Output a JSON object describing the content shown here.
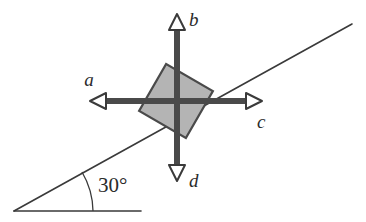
{
  "figure": {
    "background_color": "#ffffff",
    "width": 366,
    "height": 222,
    "incline": {
      "angle_label": "30°",
      "angle_degrees": 30,
      "line_color": "#3a3a3a",
      "baseline_color": "#3a3a3a",
      "vertex": {
        "x": 14,
        "y": 211
      },
      "slope_end": {
        "x": 352,
        "y": 24
      },
      "baseline_end": {
        "x": 141,
        "y": 211
      }
    },
    "block": {
      "name": "block",
      "fill_color": "#b4b4b4",
      "stroke_color": "#4a4a4a",
      "center": {
        "x": 176,
        "y": 101
      },
      "side": 54,
      "rotation_degrees": 30
    },
    "vectors": [
      {
        "id": "a",
        "label": "a",
        "direction": "left",
        "tip": {
          "x": 90,
          "y": 101
        },
        "label_pos": {
          "x": 89,
          "y": 86
        }
      },
      {
        "id": "b",
        "label": "b",
        "direction": "up",
        "tip": {
          "x": 177,
          "y": 14
        },
        "label_pos": {
          "x": 189,
          "y": 25
        }
      },
      {
        "id": "c",
        "label": "c",
        "direction": "right",
        "tip": {
          "x": 262,
          "y": 101
        },
        "label_pos": {
          "x": 258,
          "y": 127
        }
      },
      {
        "id": "d",
        "label": "d",
        "direction": "down",
        "tip": {
          "x": 177,
          "y": 181
        },
        "label_pos": {
          "x": 189,
          "y": 186
        }
      }
    ],
    "arrow_style": {
      "shaft_color": "#4a4a4a",
      "shaft_width": 6,
      "head_fill": "#ffffff",
      "head_stroke": "#3a3a3a"
    }
  }
}
